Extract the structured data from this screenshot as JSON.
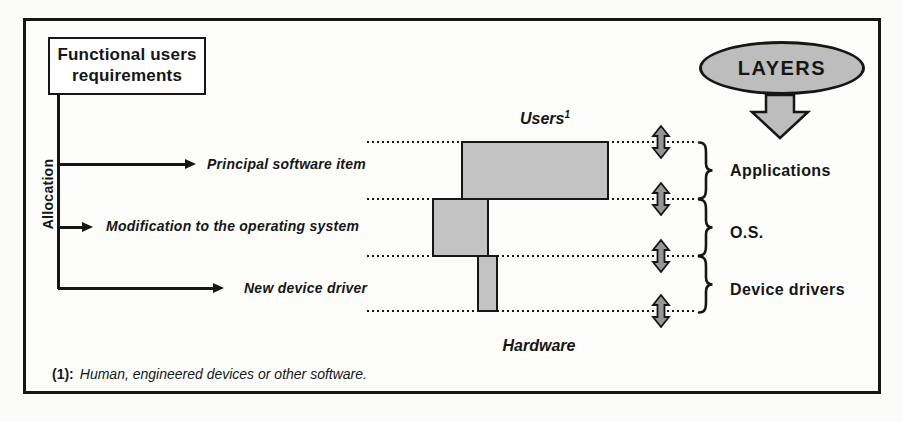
{
  "figure": {
    "requirements_box": {
      "line1": "Functional users",
      "line2": "requirements"
    },
    "allocation_label": "Allocation",
    "allocated_items": [
      {
        "label": "Principal software item"
      },
      {
        "label": "Modification to the operating system"
      },
      {
        "label": "New device driver"
      }
    ],
    "users_label": "Users",
    "users_footnote_ref": "1",
    "hardware_label": "Hardware",
    "layers_title": "LAYERS",
    "layers": [
      {
        "label": "Applications"
      },
      {
        "label": "O.S."
      },
      {
        "label": "Device drivers"
      }
    ],
    "footnote": {
      "marker": "(1):",
      "text": "Human, engineered devices or other software."
    },
    "colors": {
      "box_fill": "#c3c3c3",
      "ellipse_fill": "#bdbdbd",
      "double_arrow_fill": "#969696",
      "ink": "#161616"
    }
  }
}
